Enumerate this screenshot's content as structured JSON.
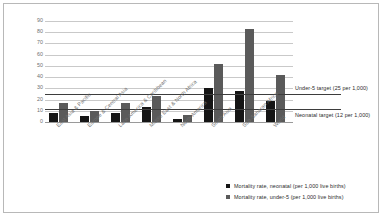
{
  "chart_data": {
    "type": "bar",
    "title": "",
    "xlabel": "",
    "ylabel": "",
    "ylim": [
      0,
      90
    ],
    "yticks": [
      90,
      80,
      70,
      60,
      50,
      40,
      30,
      20,
      10,
      0
    ],
    "grid": true,
    "legend_position": "bottom-right",
    "categories": [
      "East Asia & Pacific",
      "Europe & Central Asia",
      "Latin America & Caribbean",
      "Middle East & North Africa",
      "North America",
      "South Asia",
      "Sub-Saharan Africa",
      "World"
    ],
    "series": [
      {
        "name": "Mortality rate, neonatal (per 1,000 live births)",
        "color": "#151515",
        "values": [
          8,
          5,
          8,
          13,
          3,
          30,
          28,
          19
        ]
      },
      {
        "name": "Mortality rate, under-5 (per 1,000 live births)",
        "color": "#5a5a5a",
        "values": [
          17,
          10,
          17,
          23,
          6,
          52,
          83,
          42
        ]
      }
    ],
    "annotations": [
      {
        "label": "Under-5 target (25 per 1,000)",
        "value": 25
      },
      {
        "label": "Neonatal target (12 per 1,000)",
        "value": 12
      }
    ]
  }
}
